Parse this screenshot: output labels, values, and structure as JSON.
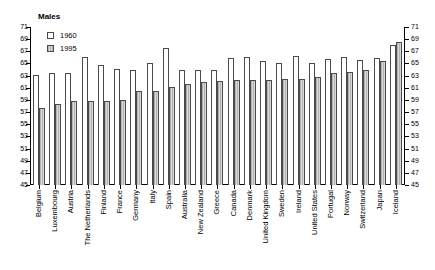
{
  "chart_data": {
    "type": "bar",
    "title": "Males",
    "xlabel": "",
    "ylabel": "",
    "ylim": [
      45,
      71
    ],
    "ytick_step": 2,
    "yticks": [
      71,
      69,
      67,
      65,
      63,
      61,
      59,
      57,
      55,
      53,
      51,
      49,
      47,
      45
    ],
    "grid": false,
    "legend_position": "top-left",
    "dual_y_axis": true,
    "categories": [
      "Belgium",
      "Luxembourg",
      "Austria",
      "The Netherlands",
      "Finland",
      "France",
      "Germany",
      "Italy",
      "Spain",
      "Australia",
      "New Zealand",
      "Greece",
      "Canada",
      "Denmark",
      "United Kingdom",
      "Sweden",
      "Ireland",
      "United States",
      "Portugal",
      "Norway",
      "Switzerland",
      "Japan",
      "Iceland"
    ],
    "series": [
      {
        "name": "1960",
        "color": "#ffffff",
        "values": [
          63.1,
          63.5,
          63.5,
          66.0,
          64.8,
          64.1,
          64.0,
          65.0,
          67.5,
          64.0,
          63.9,
          63.9,
          65.9,
          66.0,
          65.4,
          65.0,
          66.2,
          65.0,
          65.7,
          66.0,
          65.5,
          65.9,
          68.0
        ]
      },
      {
        "name": "1995",
        "color": "#c9c9c9",
        "values": [
          57.6,
          58.4,
          58.8,
          58.9,
          58.8,
          59.0,
          60.4,
          60.4,
          61.2,
          61.6,
          61.9,
          62.1,
          62.3,
          62.3,
          62.2,
          62.5,
          62.4,
          62.8,
          63.4,
          63.6,
          64.0,
          65.4,
          68.5
        ]
      }
    ]
  },
  "legend": {
    "entries": [
      {
        "label": "1960",
        "swatch": "open-white-square"
      },
      {
        "label": "1995",
        "swatch": "hatched-gray-square"
      }
    ]
  }
}
